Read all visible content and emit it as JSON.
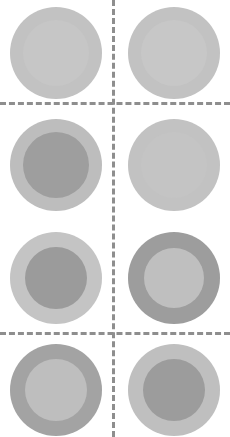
{
  "figure": {
    "width": 230,
    "height": 437,
    "background_color": "#ffffff"
  },
  "gridlines": {
    "color": "#8e8e8e",
    "style": "dashed",
    "thickness_px": 3,
    "vertical": [
      {
        "name": "column-divider",
        "x": 112
      }
    ],
    "horizontal": [
      {
        "name": "row1-row2-divider",
        "y": 102
      },
      {
        "name": "row3-row4-divider",
        "y": 332
      }
    ]
  },
  "cells": [
    {
      "id": "cell-r1c1",
      "row": 1,
      "column": 1,
      "x": 10,
      "y": 7,
      "outer_diameter": 92,
      "inner_diameter": 66,
      "outer_color": "#c2c2c2",
      "inner_color": "#c6c6c6",
      "label": "row 1 left"
    },
    {
      "id": "cell-r1c2",
      "row": 1,
      "column": 2,
      "x": 128,
      "y": 7,
      "outer_diameter": 92,
      "inner_diameter": 66,
      "outer_color": "#c2c2c2",
      "inner_color": "#c7c7c7",
      "label": "row 1 right"
    },
    {
      "id": "cell-r2c1",
      "row": 2,
      "column": 1,
      "x": 10,
      "y": 119,
      "outer_diameter": 92,
      "inner_diameter": 66,
      "outer_color": "#bdbdbd",
      "inner_color": "#9e9e9e",
      "label": "row 2 left"
    },
    {
      "id": "cell-r2c2",
      "row": 2,
      "column": 2,
      "x": 128,
      "y": 119,
      "outer_diameter": 92,
      "inner_diameter": 66,
      "outer_color": "#c2c2c2",
      "inner_color": "#c4c4c4",
      "label": "row 2 right"
    },
    {
      "id": "cell-r3c1",
      "row": 3,
      "column": 1,
      "x": 10,
      "y": 232,
      "outer_diameter": 92,
      "inner_diameter": 62,
      "outer_color": "#c4c4c4",
      "inner_color": "#9b9b9b",
      "label": "row 3 left"
    },
    {
      "id": "cell-r3c2",
      "row": 3,
      "column": 2,
      "x": 128,
      "y": 232,
      "outer_diameter": 92,
      "inner_diameter": 60,
      "outer_color": "#9d9d9d",
      "inner_color": "#bfbfbf",
      "label": "row 3 right"
    },
    {
      "id": "cell-r4c1",
      "row": 4,
      "column": 1,
      "x": 10,
      "y": 344,
      "outer_diameter": 92,
      "inner_diameter": 62,
      "outer_color": "#a3a3a3",
      "inner_color": "#bebebe",
      "label": "row 4 left"
    },
    {
      "id": "cell-r4c2",
      "row": 4,
      "column": 2,
      "x": 128,
      "y": 344,
      "outer_diameter": 92,
      "inner_diameter": 62,
      "outer_color": "#bfbfbf",
      "inner_color": "#9c9c9c",
      "label": "row 4 right"
    }
  ]
}
